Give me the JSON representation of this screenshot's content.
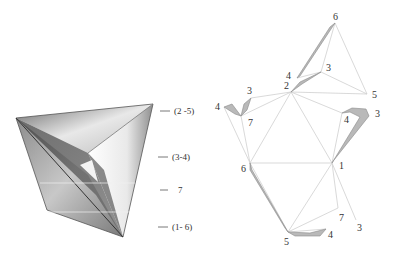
{
  "left_figure": {
    "description": "3D shaded folded polyhedron",
    "labels": [
      {
        "id": "label-2-5",
        "text": "(2 -5)"
      },
      {
        "id": "label-3-4",
        "text": "(3-4)"
      },
      {
        "id": "label-7",
        "text": "7"
      },
      {
        "id": "label-1-6",
        "text": "(1- 6)"
      }
    ]
  },
  "right_figure": {
    "description": "Unfolded net with numbered vertices",
    "vertices": [
      {
        "id": "v6-top",
        "text": "6"
      },
      {
        "id": "v4-top",
        "text": "4"
      },
      {
        "id": "v3-top",
        "text": "3"
      },
      {
        "id": "v2",
        "text": "2"
      },
      {
        "id": "v5-right",
        "text": "5"
      },
      {
        "id": "v3-left",
        "text": "3"
      },
      {
        "id": "v4-left",
        "text": "4"
      },
      {
        "id": "v7-left",
        "text": "7"
      },
      {
        "id": "v4-right",
        "text": "4"
      },
      {
        "id": "v3-right",
        "text": "3"
      },
      {
        "id": "v6-left",
        "text": "6"
      },
      {
        "id": "v1",
        "text": "1"
      },
      {
        "id": "v7-bottom",
        "text": "7"
      },
      {
        "id": "v3-bottom",
        "text": "3"
      },
      {
        "id": "v4-bottom",
        "text": "4"
      },
      {
        "id": "v5-bottom",
        "text": "5"
      }
    ]
  }
}
